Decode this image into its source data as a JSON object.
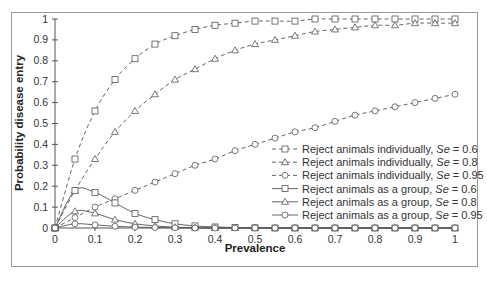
{
  "chart_data": {
    "type": "line",
    "title": "",
    "xlabel": "Prevalence",
    "ylabel": "Probability disease entry",
    "xlim": [
      0,
      1
    ],
    "ylim": [
      0,
      1
    ],
    "x_ticks": [
      "0",
      "0.1",
      "0.2",
      "0.3",
      "0.4",
      "0.5",
      "0.6",
      "0.7",
      "0.8",
      "0.9",
      "1"
    ],
    "y_ticks": [
      "0",
      "0.1",
      "0.2",
      "0.3",
      "0.4",
      "0.5",
      "0.6",
      "0.7",
      "0.8",
      "0.9",
      "1"
    ],
    "grid": false,
    "legend_position": "lower right (inside plot)",
    "x": [
      0,
      0.05,
      0.1,
      0.15,
      0.2,
      0.25,
      0.3,
      0.35,
      0.4,
      0.45,
      0.5,
      0.55,
      0.6,
      0.65,
      0.7,
      0.75,
      0.8,
      0.85,
      0.9,
      0.95,
      1.0
    ],
    "series": [
      {
        "name": "Reject animals individually, Se = 0.6",
        "label_prefix": "Reject animals individually, ",
        "se": "0.6",
        "style": "dashed",
        "marker": "square",
        "values": [
          0,
          0.33,
          0.56,
          0.71,
          0.81,
          0.88,
          0.92,
          0.95,
          0.97,
          0.98,
          0.99,
          0.99,
          0.99,
          1.0,
          1.0,
          1.0,
          1.0,
          1.0,
          1.0,
          1.0,
          1.0
        ]
      },
      {
        "name": "Reject animals individually, Se = 0.8",
        "label_prefix": "Reject animals individually, ",
        "se": "0.8",
        "style": "dashed",
        "marker": "triangle",
        "values": [
          0,
          0.18,
          0.33,
          0.46,
          0.56,
          0.64,
          0.71,
          0.76,
          0.81,
          0.85,
          0.88,
          0.9,
          0.92,
          0.94,
          0.95,
          0.96,
          0.97,
          0.97,
          0.98,
          0.98,
          0.98
        ]
      },
      {
        "name": "Reject animals individually, Se = 0.95",
        "label_prefix": "Reject animals individually, ",
        "se": "0.95",
        "style": "dashed",
        "marker": "circle",
        "values": [
          0,
          0.05,
          0.1,
          0.14,
          0.18,
          0.22,
          0.26,
          0.3,
          0.33,
          0.37,
          0.4,
          0.43,
          0.46,
          0.48,
          0.51,
          0.54,
          0.56,
          0.58,
          0.6,
          0.62,
          0.64
        ]
      },
      {
        "name": "Reject animals as a group, Se = 0.6",
        "label_prefix": "Reject animals as a group, ",
        "se": "0.6",
        "style": "solid",
        "marker": "square",
        "values": [
          0,
          0.18,
          0.17,
          0.12,
          0.07,
          0.04,
          0.02,
          0.01,
          0.005,
          0.002,
          0.001,
          0,
          0,
          0,
          0,
          0,
          0,
          0,
          0,
          0,
          0
        ]
      },
      {
        "name": "Reject animals as a group, Se = 0.8",
        "label_prefix": "Reject animals as a group, ",
        "se": "0.8",
        "style": "solid",
        "marker": "triangle",
        "values": [
          0,
          0.08,
          0.07,
          0.04,
          0.02,
          0.01,
          0.004,
          0.001,
          0,
          0,
          0,
          0,
          0,
          0,
          0,
          0,
          0,
          0,
          0,
          0,
          0
        ]
      },
      {
        "name": "Reject animals as a group, Se = 0.95",
        "label_prefix": "Reject animals as a group, ",
        "se": "0.95",
        "style": "solid",
        "marker": "circle",
        "values": [
          0,
          0.02,
          0.015,
          0.008,
          0.004,
          0.002,
          0.001,
          0,
          0,
          0,
          0,
          0,
          0,
          0,
          0,
          0,
          0,
          0,
          0,
          0,
          0
        ]
      }
    ],
    "legend_se_label": "Se"
  },
  "colors": {
    "line": "#555555",
    "text": "#333333",
    "frame": "#9a9a9a",
    "background": "#ffffff"
  }
}
